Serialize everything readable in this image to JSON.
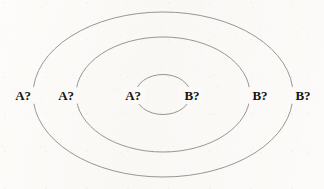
{
  "figure": {
    "name": "concentric-ellipses-diagram",
    "background_color": "#fbfaf8",
    "stroke_color": "#8d8a85",
    "text_color": "#191613",
    "canvas": {
      "width": 324,
      "height": 189
    },
    "center": {
      "x": 163,
      "y": 94.5
    },
    "ellipses": [
      {
        "id": "outer",
        "cx": 163,
        "cy": 94.5,
        "rx": 130,
        "ry": 82.5,
        "stroke_width": 0.9
      },
      {
        "id": "middle",
        "cx": 163,
        "cy": 94.5,
        "rx": 87,
        "ry": 57.5,
        "stroke_width": 0.9
      },
      {
        "id": "inner",
        "cx": 163,
        "cy": 94.5,
        "rx": 27.5,
        "ry": 20,
        "stroke_width": 0.9
      }
    ],
    "labels": [
      {
        "id": "label-a-outer",
        "text": "A?",
        "x": 23,
        "y": 95,
        "ellipse": "outer",
        "side": "left"
      },
      {
        "id": "label-a-middle",
        "text": "A?",
        "x": 66,
        "y": 95,
        "ellipse": "middle",
        "side": "left"
      },
      {
        "id": "label-a-inner",
        "text": "A?",
        "x": 133,
        "y": 95,
        "ellipse": "inner",
        "side": "left"
      },
      {
        "id": "label-b-inner",
        "text": "B?",
        "x": 192,
        "y": 95,
        "ellipse": "inner",
        "side": "right"
      },
      {
        "id": "label-b-middle",
        "text": "B?",
        "x": 260,
        "y": 95,
        "ellipse": "middle",
        "side": "right"
      },
      {
        "id": "label-b-outer",
        "text": "B?",
        "x": 303,
        "y": 95,
        "ellipse": "outer",
        "side": "right"
      }
    ]
  }
}
